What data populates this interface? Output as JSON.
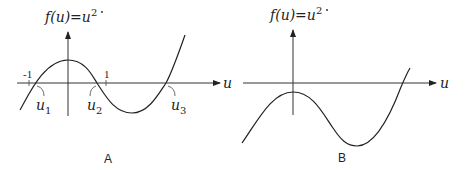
{
  "panels": [
    {
      "id": "A",
      "caption": "A",
      "title": {
        "prefix": "f(u)=",
        "var": "u",
        "dot": "·",
        "exp": "2"
      },
      "x_axis_label": "u",
      "ticks": [
        "-1",
        "1"
      ],
      "roots": [
        {
          "name": "u",
          "sub": "1"
        },
        {
          "name": "u",
          "sub": "2"
        },
        {
          "name": "u",
          "sub": "3"
        }
      ],
      "curve_description": "cubic-like curve: rises from below, local max above axis at u=0, crosses at u1<−1... u2 between 0 and 1, local min below axis, crosses again at u3"
    },
    {
      "id": "B",
      "caption": "B",
      "title": {
        "prefix": "f(u)=",
        "var": "u",
        "dot": "·",
        "exp": "2"
      },
      "x_axis_label": "u",
      "curve_description": "cubic-like curve entirely below axis except one root: local max below axis at u=0, local min further right, crosses axis once"
    }
  ],
  "colors": {
    "ink": "#222222",
    "background": "#ffffff"
  }
}
